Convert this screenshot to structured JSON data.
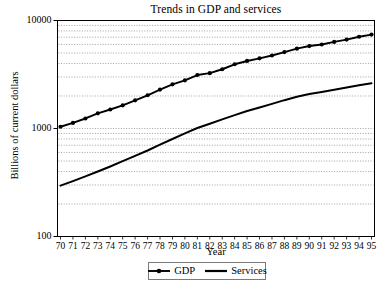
{
  "chart_data": {
    "type": "line",
    "title": "Trends in GDP and services",
    "xlabel": "Year",
    "ylabel": "Billions of current dollars",
    "yscale": "log",
    "ylim": [
      100,
      10000
    ],
    "ytick_labels": [
      "10000",
      "1000",
      "100"
    ],
    "ytick_values": [
      10000,
      1000,
      100
    ],
    "grid": "horizontal-dotted",
    "legend_position": "below-axes",
    "x": [
      70,
      71,
      72,
      73,
      74,
      75,
      76,
      77,
      78,
      79,
      80,
      81,
      82,
      83,
      84,
      85,
      86,
      87,
      88,
      89,
      90,
      91,
      92,
      93,
      94,
      95
    ],
    "xtick_labels": [
      "70",
      "71",
      "72",
      "73",
      "74",
      "75",
      "76",
      "77",
      "78",
      "79",
      "80",
      "81",
      "82",
      "83",
      "84",
      "85",
      "86",
      "87",
      "88",
      "89",
      "90",
      "91",
      "92",
      "93",
      "94",
      "95"
    ],
    "series": [
      {
        "name": "GDP",
        "marker": "filled-circle",
        "color": "#000000",
        "values": [
          1038,
          1127,
          1238,
          1383,
          1500,
          1638,
          1825,
          2031,
          2295,
          2563,
          2790,
          3128,
          3255,
          3537,
          3933,
          4220,
          4463,
          4740,
          5104,
          5484,
          5803,
          5996,
          6338,
          6657,
          7072,
          7400
        ]
      },
      {
        "name": "Services",
        "marker": "none",
        "color": "#000000",
        "values": [
          296,
          326,
          360,
          400,
          445,
          498,
          558,
          626,
          708,
          800,
          902,
          1010,
          1105,
          1215,
          1330,
          1450,
          1565,
          1690,
          1830,
          1965,
          2085,
          2180,
          2285,
          2400,
          2510,
          2620
        ]
      }
    ],
    "legend": [
      {
        "label": "GDP",
        "style": "line-with-marker"
      },
      {
        "label": "Services",
        "style": "line"
      }
    ]
  }
}
